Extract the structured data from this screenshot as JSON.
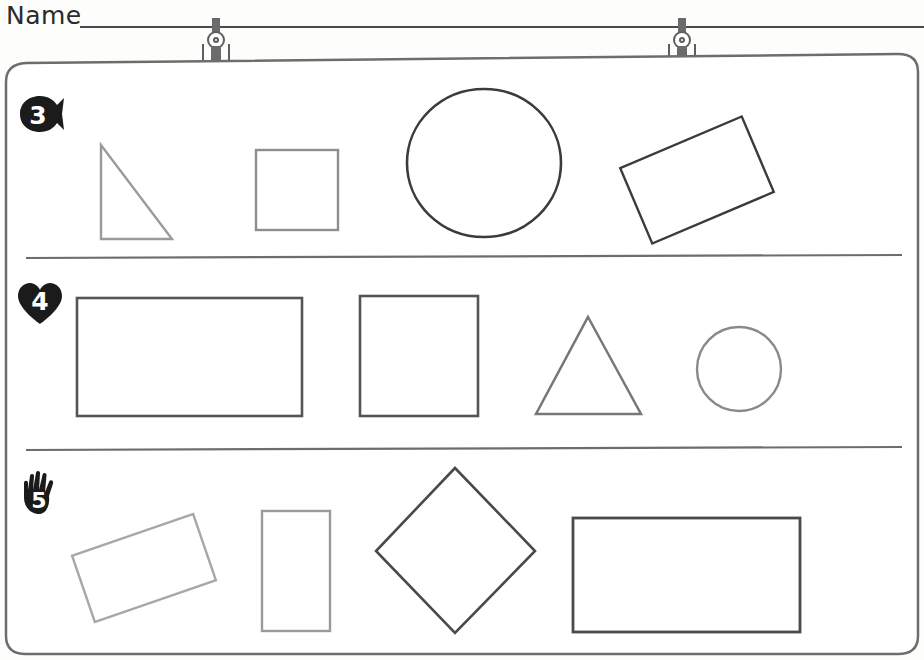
{
  "worksheet": {
    "name_label": "Name",
    "name_line_value": "",
    "name_line_placeholder": ""
  },
  "board": {
    "hanging_clips": [
      {
        "name": "clip-left",
        "x": 199,
        "y": 18
      },
      {
        "name": "clip-right",
        "x": 665,
        "y": 18
      }
    ],
    "frame_color": "#6d6d6d",
    "background_color": "#fdfdfc"
  },
  "rows": [
    {
      "id": "row-3",
      "marker_icon": "fish-icon",
      "marker_number": "3",
      "marker_shape": "fish",
      "count": 4,
      "shapes": [
        {
          "name": "right-triangle",
          "type": "triangle-right",
          "color": "#9a9a9a"
        },
        {
          "name": "square",
          "type": "square",
          "color": "#8e8e8e"
        },
        {
          "name": "circle",
          "type": "circle",
          "color": "#3b3b3b"
        },
        {
          "name": "rotated-rectangle",
          "type": "rectangle",
          "rotation": -23,
          "color": "#3b3b3b"
        }
      ]
    },
    {
      "id": "row-4",
      "marker_icon": "heart-icon",
      "marker_number": "4",
      "marker_shape": "heart",
      "count": 4,
      "shapes": [
        {
          "name": "wide-rectangle",
          "type": "rectangle",
          "color": "#555555"
        },
        {
          "name": "tall-square-rectangle",
          "type": "rectangle",
          "color": "#555555"
        },
        {
          "name": "equilateral-triangle",
          "type": "triangle",
          "color": "#777777"
        },
        {
          "name": "small-circle",
          "type": "circle",
          "color": "#8a8a8a"
        }
      ]
    },
    {
      "id": "row-5",
      "marker_icon": "hand-icon",
      "marker_number": "5",
      "marker_shape": "hand",
      "count": 4,
      "shapes": [
        {
          "name": "tilted-rectangle",
          "type": "rectangle",
          "rotation": -19,
          "color": "#a7a7a7"
        },
        {
          "name": "vertical-rectangle",
          "type": "rectangle",
          "color": "#9a9a9a"
        },
        {
          "name": "diamond",
          "type": "diamond",
          "rotation": 45,
          "color": "#4a4a4a"
        },
        {
          "name": "large-wide-rectangle",
          "type": "rectangle",
          "color": "#4a4a4a"
        }
      ]
    }
  ]
}
